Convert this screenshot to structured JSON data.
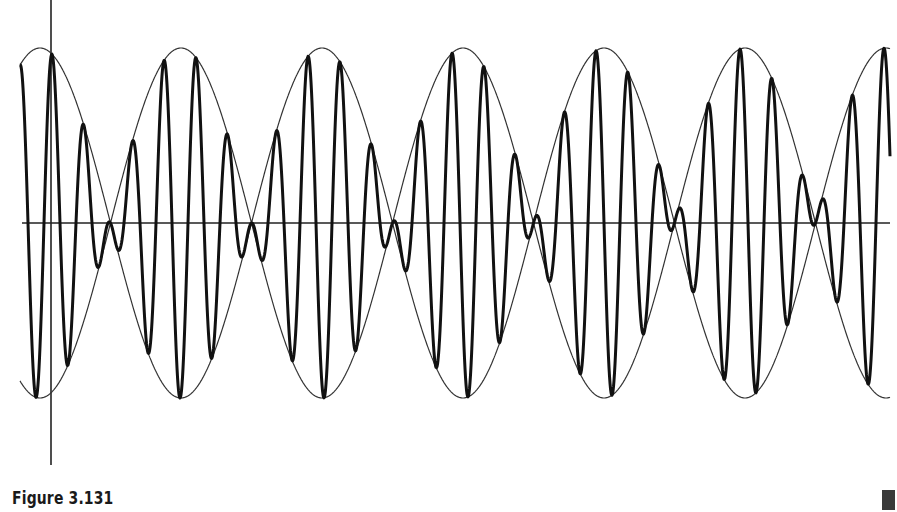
{
  "figure": {
    "caption": "Figure 3.131"
  },
  "chart_data": {
    "type": "line",
    "title": "",
    "xlabel": "",
    "ylabel": "",
    "grid": false,
    "legend": null,
    "axes": {
      "x_axis_y_px": 223,
      "x_axis_range_px": [
        22,
        890
      ],
      "y_axis_x_px": 51,
      "y_axis_range_px": [
        0,
        465
      ]
    },
    "envelope": {
      "amplitude_px": 175,
      "peak_x_px": 40,
      "half_period_px": 141,
      "zero_crossings_x_px": [
        110,
        250,
        390,
        530,
        675,
        815
      ]
    },
    "carrier": {
      "period_px": 32,
      "phase_peak_x_px": 52
    },
    "x_range_px": [
      20,
      890
    ],
    "series": [
      {
        "name": "modulated wave",
        "stroke": "#111111",
        "width": 3
      },
      {
        "name": "upper envelope",
        "stroke": "#333333",
        "width": 1.2
      },
      {
        "name": "lower envelope",
        "stroke": "#333333",
        "width": 1.2
      }
    ]
  }
}
